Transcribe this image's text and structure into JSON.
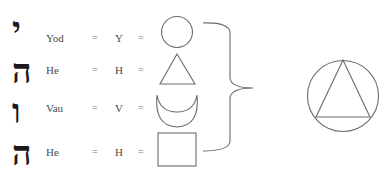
{
  "rows": [
    {
      "hebrew": "י",
      "name": "Yod",
      "eq1": "=",
      "latin": "Y",
      "eq2": "=",
      "shape": "circle"
    },
    {
      "hebrew": "ה",
      "name": "He",
      "eq1": "=",
      "latin": "H",
      "eq2": "=",
      "shape": "triangle"
    },
    {
      "hebrew": "ו",
      "name": "Vau",
      "eq1": "=",
      "latin": "V",
      "eq2": "=",
      "shape": "crescent"
    },
    {
      "hebrew": "ה",
      "name": "He",
      "eq1": "=",
      "latin": "H",
      "eq2": "=",
      "shape": "square"
    }
  ],
  "combined_symbol": "circle-with-inscribed-triangle",
  "colors": {
    "stroke": "#6b6b6b",
    "text": "#4a4a4a",
    "hebrew": "#1a1a1a"
  }
}
